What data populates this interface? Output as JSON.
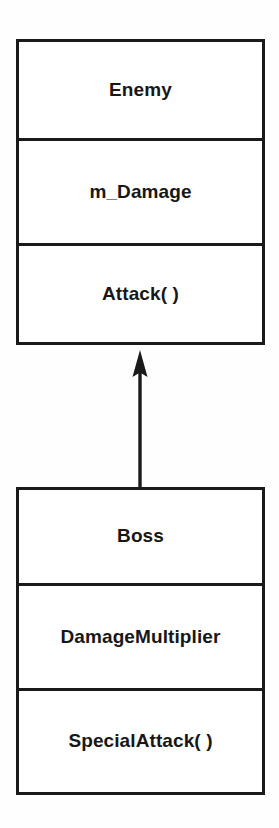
{
  "diagram": {
    "type": "uml-class-diagram",
    "background_color": "#fefefe",
    "line_color": "#1a1a1a",
    "text_color": "#171717",
    "classes": [
      {
        "id": "enemy",
        "name": "Enemy",
        "attribute": "m_Damage",
        "method": "Attack( )"
      },
      {
        "id": "boss",
        "name": "Boss",
        "attribute": "DamageMultiplier",
        "method": "SpecialAttack( )"
      }
    ],
    "relationship": {
      "kind": "generalization",
      "label": "",
      "from": "Boss",
      "to": "Enemy",
      "arrow_style": "solid-filled-triangle",
      "direction": "up"
    }
  }
}
